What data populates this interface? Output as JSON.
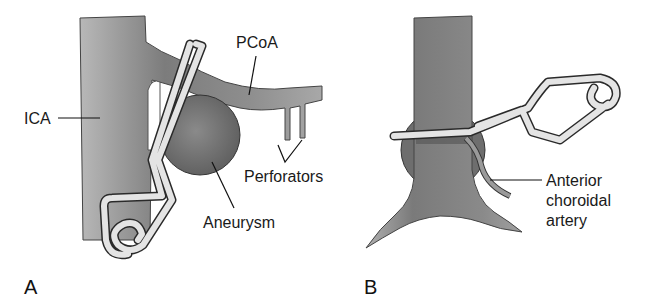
{
  "panels": [
    {
      "id": "A",
      "letter": "A",
      "labels": {
        "ica": "ICA",
        "pcoa": "PCoA",
        "perforators": "Perforators",
        "aneurysm": "Aneurysm"
      }
    },
    {
      "id": "B",
      "letter": "B",
      "labels": {
        "acha_line1": "Anterior",
        "acha_line2": "choroidal",
        "acha_line3": "artery"
      }
    }
  ],
  "colors": {
    "vessel": "#8a8a8a",
    "vessel_dark": "#6e6e6e",
    "clip_fill": "#e4e4e4",
    "outline": "#2a2a2a",
    "text": "#1a1a1a"
  }
}
